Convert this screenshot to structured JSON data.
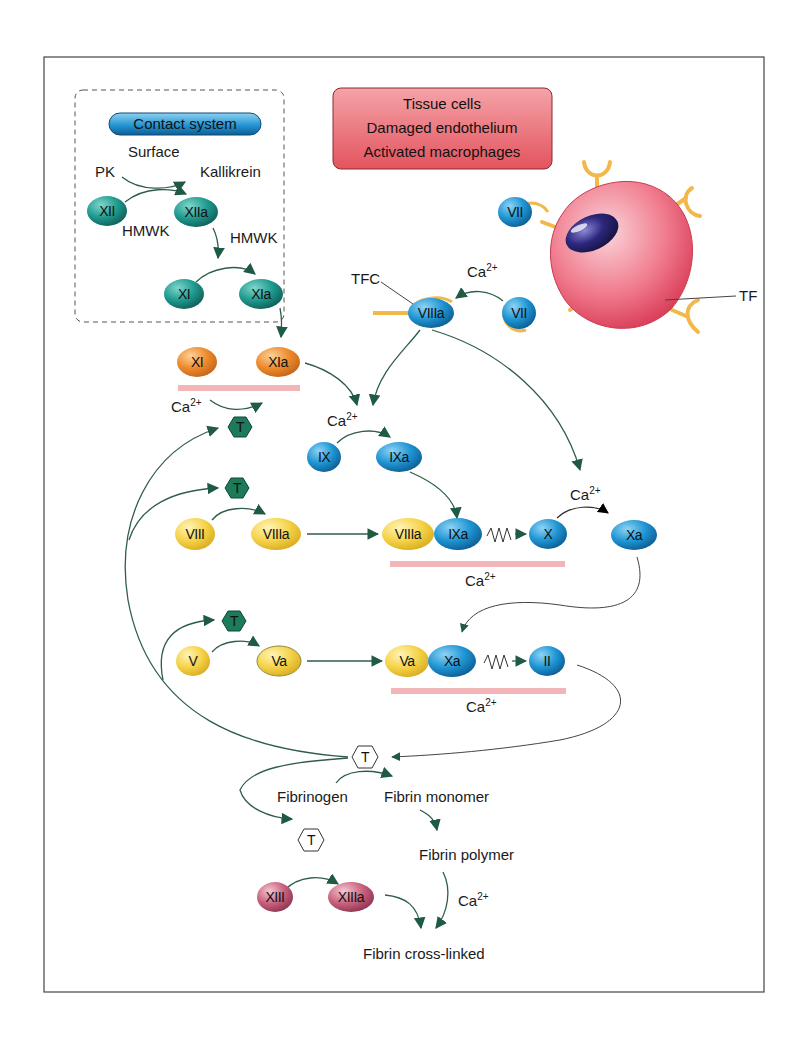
{
  "contact_system": {
    "header": "Contact system",
    "labels": {
      "pk": "PK",
      "surface": "Surface",
      "kallikrein": "Kallikrein",
      "hmwk1": "HMWK",
      "hmwk2": "HMWK"
    },
    "nodes": {
      "xii": "XII",
      "xiia": "XIIa",
      "xi": "XI",
      "xia": "XIa"
    }
  },
  "tissue_box": {
    "lines": [
      "Tissue cells",
      "Damaged endothelium",
      "Activated macrophages"
    ]
  },
  "cell": {
    "nodes": {
      "vii_top": "VII",
      "vii_bottom": "VII",
      "viiia": "VIIIa"
    },
    "labels": {
      "tfc": "TFC",
      "tf": "TF",
      "ca": "Ca",
      "ca_sup": "2+"
    }
  },
  "intrinsic": {
    "xi": "XI",
    "xia": "XIa",
    "ca1": "Ca",
    "ca1_sup": "2+",
    "t1": "T",
    "ca2": "Ca",
    "ca2_sup": "2+",
    "ix": "IX",
    "ixa": "IXa",
    "t2": "T",
    "viii": "VIII",
    "viiia": "VIIIa",
    "tenase_viiia": "VIIIa",
    "tenase_ixa": "IXa",
    "x": "X",
    "ca3": "Ca",
    "ca3_sup": "2+",
    "xa": "Xa",
    "ca4": "Ca",
    "ca4_sup": "2+",
    "t3": "T",
    "v": "V",
    "va": "Va",
    "pro_va": "Va",
    "pro_xa": "Xa",
    "ii": "II",
    "ca5": "Ca",
    "ca5_sup": "2+"
  },
  "common": {
    "t_main": "T",
    "fibrinogen": "Fibrinogen",
    "fibrin_monomer": "Fibrin monomer",
    "t_xiii": "T",
    "fibrin_polymer": "Fibrin polymer",
    "xiii": "XIII",
    "xiiia": "XIIIa",
    "ca": "Ca",
    "ca_sup": "2+",
    "fibrin_crosslinked": "Fibrin cross-linked"
  },
  "colors": {
    "teal": "#1f8f86",
    "blue": "#1e8fcf",
    "orange": "#ef8a2a",
    "yellow": "#f6d44a",
    "mauve": "#c45b78",
    "thrombin_green": "#1d7a5a",
    "arrow": "#2f5d4a",
    "membrane": "#f3b6b8",
    "cell_pink": "#ee6f82",
    "nucleus": "#2a2570",
    "tf_yellow": "#f2b84a"
  }
}
